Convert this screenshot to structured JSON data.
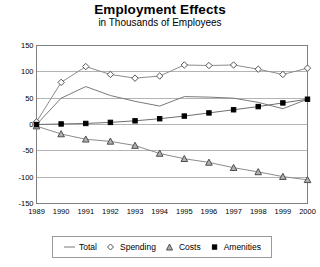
{
  "chart_data": {
    "type": "line",
    "title": "Employment Effects",
    "subtitle": "in Thousands of Employees",
    "xlabel": "",
    "ylabel": "",
    "categories": [
      "1989",
      "1990",
      "1991",
      "1992",
      "1993",
      "1994",
      "1995",
      "1996",
      "1997",
      "1998",
      "1999",
      "2000"
    ],
    "x": [
      1989,
      1990,
      1991,
      1992,
      1993,
      1994,
      1995,
      1996,
      1997,
      1998,
      1999,
      2000
    ],
    "ylim": [
      -150,
      150
    ],
    "yticks": [
      150,
      100,
      50,
      0,
      -50,
      -100,
      -150
    ],
    "ytick_labels": [
      "150",
      "100",
      "50",
      "0",
      "-50",
      "-100",
      "-150"
    ],
    "grid": true,
    "legend_position": "bottom",
    "series": [
      {
        "name": "Total",
        "marker": "none",
        "color": "#7a7a7a",
        "values": [
          0,
          50,
          72,
          55,
          44,
          35,
          53,
          52,
          50,
          42,
          30,
          48
        ]
      },
      {
        "name": "Spending",
        "marker": "open-diamond",
        "color": "#555555",
        "values": [
          5,
          80,
          110,
          95,
          88,
          92,
          113,
          112,
          113,
          105,
          95,
          107
        ]
      },
      {
        "name": "Costs",
        "marker": "triangle",
        "color": "#b0b0b0",
        "values": [
          -3,
          -18,
          -28,
          -32,
          -40,
          -55,
          -65,
          -72,
          -82,
          -90,
          -99,
          -105
        ]
      },
      {
        "name": "Amenities",
        "marker": "filled-square",
        "color": "#000000",
        "values": [
          0,
          1,
          2,
          4,
          7,
          11,
          16,
          22,
          28,
          34,
          41,
          48
        ]
      }
    ]
  },
  "legend": {
    "items": [
      {
        "label": "Total",
        "marker": "line-icon"
      },
      {
        "label": "Spending",
        "marker": "open-diamond-icon"
      },
      {
        "label": "Costs",
        "marker": "triangle-icon"
      },
      {
        "label": "Amenities",
        "marker": "filled-square-icon"
      }
    ]
  }
}
